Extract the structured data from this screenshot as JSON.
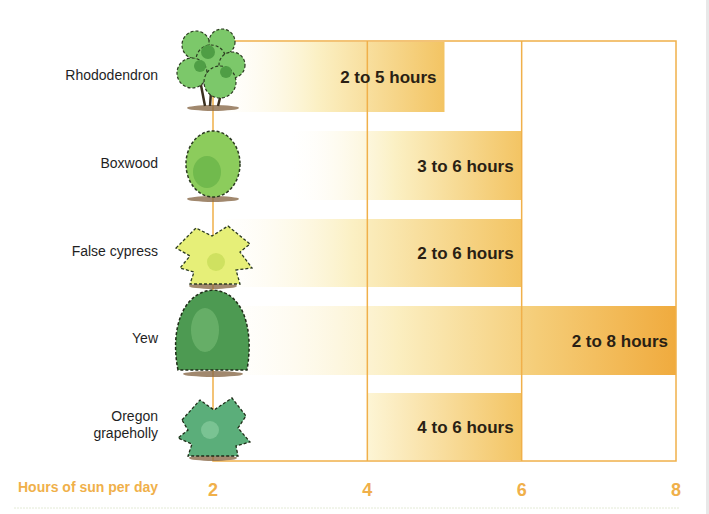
{
  "chart_data": {
    "type": "bar",
    "orientation": "horizontal",
    "title": "",
    "xlabel": "Hours of sun per day",
    "ylabel": "",
    "xlim": [
      2,
      8
    ],
    "xticks": [
      2,
      4,
      6,
      8
    ],
    "grid": true,
    "categories": [
      "Rhododendron",
      "Boxwood",
      "False cypress",
      "Yew",
      "Oregon grapeholly"
    ],
    "category_lines": [
      [
        "Rhododendron"
      ],
      [
        "Boxwood"
      ],
      [
        "False cypress"
      ],
      [
        "Yew"
      ],
      [
        "Oregon",
        "grapeholly"
      ]
    ],
    "ranges": [
      {
        "start": 2,
        "end": 5,
        "label": "2 to 5 hours"
      },
      {
        "start": 3,
        "end": 6,
        "label": "3 to 6 hours"
      },
      {
        "start": 2,
        "end": 6,
        "label": "2 to 6 hours"
      },
      {
        "start": 2,
        "end": 8,
        "label": "2 to 8 hours"
      },
      {
        "start": 4,
        "end": 6,
        "label": "4 to 6 hours"
      }
    ],
    "plants": [
      "rhododendron-icon",
      "boxwood-icon",
      "false-cypress-icon",
      "yew-icon",
      "oregon-grapeholly-icon"
    ]
  },
  "colors": {
    "grid": "#f0b04a",
    "bar_light": "#fdf6dc",
    "bar_mid": "#f7dd92",
    "bar_dark": "#f0aa3c",
    "axis_text": "#f0b04a"
  }
}
